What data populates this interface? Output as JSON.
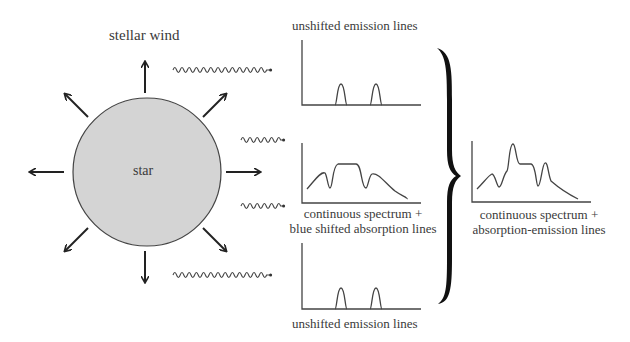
{
  "labels": {
    "stellar_wind": "stellar wind",
    "star": "star",
    "top_panel": "unshifted emission lines",
    "middle_panel_line1": "continuous spectrum  +",
    "middle_panel_line2": "blue shifted absorption lines",
    "bottom_panel": "unshifted emission lines",
    "result_line1": "continuous spectrum  +",
    "result_line2": "absorption-emission lines"
  },
  "colors": {
    "star_fill": "#d4d4d4",
    "stroke": "#222222",
    "text": "#3a3a3a"
  },
  "diagram": {
    "star": {
      "cx": 147,
      "cy": 172,
      "r": 74
    },
    "arrows": [
      "up",
      "up-right",
      "right",
      "down-right",
      "down",
      "down-left",
      "left",
      "up-left"
    ],
    "light_rays": [
      "top-long",
      "middle-upper-short",
      "middle-lower-short",
      "bottom-long"
    ],
    "panels": [
      "top-emission",
      "middle-absorption",
      "bottom-emission",
      "result-combined"
    ]
  }
}
